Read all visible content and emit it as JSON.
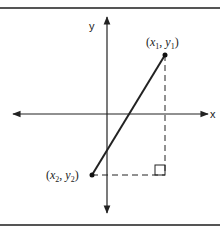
{
  "diagram": {
    "type": "coordinate-plane",
    "axes": {
      "x_label": "x",
      "y_label": "y"
    },
    "points": [
      {
        "id": "p1",
        "label_var_x": "x",
        "label_sub_x": "1",
        "label_var_y": "y",
        "label_sub_y": "1"
      },
      {
        "id": "p2",
        "label_var_x": "x",
        "label_sub_x": "2",
        "label_var_y": "y",
        "label_sub_y": "2"
      }
    ],
    "segment": "line segment connecting (x1, y1) and (x2, y2)",
    "right_angle_marker": true,
    "colors": {
      "line": "#222222",
      "border": "#555555",
      "background": "#ffffff"
    }
  }
}
